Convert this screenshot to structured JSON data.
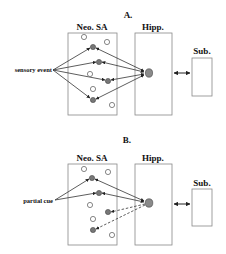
{
  "panels": [
    {
      "id": "A",
      "title": "A.",
      "regions": {
        "neo": "Neo. SA",
        "hipp": "Hipp.",
        "sub": "Sub."
      },
      "input_label": "sensory event",
      "connection_style": "solid-bidirectional"
    },
    {
      "id": "B",
      "title": "B.",
      "regions": {
        "neo": "Neo. SA",
        "hipp": "Hipp.",
        "sub": "Sub."
      },
      "input_label": "partial cue",
      "connection_style": "solid-and-dashed-retrieval"
    }
  ],
  "colors": {
    "stroke": "#333333",
    "box": "#888888",
    "filled_node": "#777777",
    "hipp_node": "#8a8a8a",
    "open_node": "#ffffff"
  }
}
